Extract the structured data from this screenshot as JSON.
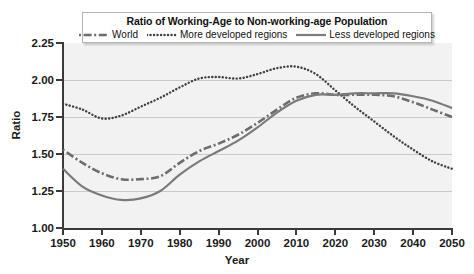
{
  "chart_data": {
    "type": "line",
    "title": "Ratio of Working-Age to Non-working-age Population",
    "xlabel": "Year",
    "ylabel": "Ratio",
    "xlim": [
      1950,
      2050
    ],
    "ylim": [
      1.0,
      2.25
    ],
    "grid": true,
    "legend_position": "top-inside",
    "x_ticks": [
      "1950",
      "1960",
      "1970",
      "1980",
      "1990",
      "2000",
      "2010",
      "2020",
      "2030",
      "2040",
      "2050"
    ],
    "y_ticks": [
      "1.00",
      "1.25",
      "1.50",
      "1.75",
      "2.00",
      "2.25"
    ],
    "x": [
      1950,
      1955,
      1960,
      1965,
      1970,
      1975,
      1980,
      1985,
      1990,
      1995,
      2000,
      2005,
      2010,
      2015,
      2020,
      2025,
      2030,
      2035,
      2040,
      2045,
      2050
    ],
    "series": [
      {
        "name": "World",
        "style": "dash-dot",
        "color": "#6d6d6d",
        "values": [
          1.53,
          1.44,
          1.37,
          1.33,
          1.33,
          1.35,
          1.44,
          1.52,
          1.57,
          1.63,
          1.71,
          1.8,
          1.88,
          1.91,
          1.9,
          1.9,
          1.9,
          1.89,
          1.85,
          1.8,
          1.75
        ]
      },
      {
        "name": "More developed regions",
        "style": "dotted",
        "color": "#3f3f3f",
        "values": [
          1.84,
          1.8,
          1.74,
          1.76,
          1.82,
          1.88,
          1.95,
          2.01,
          2.02,
          2.01,
          2.04,
          2.08,
          2.09,
          2.04,
          1.93,
          1.82,
          1.72,
          1.62,
          1.53,
          1.45,
          1.4
        ]
      },
      {
        "name": "Less developed regions",
        "style": "solid",
        "color": "#7a7a7a",
        "values": [
          1.4,
          1.28,
          1.22,
          1.19,
          1.2,
          1.25,
          1.36,
          1.45,
          1.52,
          1.59,
          1.68,
          1.78,
          1.86,
          1.9,
          1.9,
          1.91,
          1.91,
          1.91,
          1.89,
          1.86,
          1.81
        ]
      }
    ]
  },
  "axes": {
    "y_title": "Ratio",
    "x_title": "Year"
  },
  "legend": {
    "title": "Ratio of Working-Age to Non-working-age Population",
    "entries": [
      {
        "label": "World",
        "style": "dash-dot"
      },
      {
        "label": "More developed regions",
        "style": "dotted"
      },
      {
        "label": "Less developed regions",
        "style": "solid"
      }
    ]
  },
  "colors": {
    "plot_background": "#f2f2f2",
    "gridline": "#c9c9c9",
    "axis": "#3a3a3a",
    "page_background": "#ffffff"
  }
}
